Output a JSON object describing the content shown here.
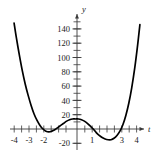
{
  "figure": {
    "title": "",
    "axis_labels": {
      "x": "t",
      "y": "y"
    },
    "colors": {
      "curve": "#000000",
      "axis": "#3a3a3a",
      "text": "#1a1a1a",
      "background": "#ffffff"
    }
  },
  "chart_data": {
    "type": "line",
    "title": "",
    "xlabel": "t",
    "ylabel": "y",
    "xlim": [
      -4.6,
      4.8
    ],
    "ylim": [
      -28,
      152
    ],
    "grid": false,
    "legend": null,
    "xticks": [
      -4,
      -3,
      -2,
      -1,
      0,
      1,
      2,
      3,
      4
    ],
    "xtick_labels": [
      "-4",
      "-3",
      "-2",
      "",
      "",
      "1",
      "",
      "3",
      "4"
    ],
    "yticks": [
      -20,
      20,
      40,
      60,
      80,
      100,
      120,
      140
    ],
    "ytick_labels": [
      "-20",
      "20",
      "40",
      "60",
      "80",
      "100",
      "120",
      "140"
    ],
    "minor_xtick_step": 0.5,
    "minor_ytick_step": 10,
    "series": [
      {
        "name": "curve",
        "x": [
          -4.25,
          -4.1,
          -3.9,
          -3.7,
          -3.5,
          -3.3,
          -3.1,
          -2.9,
          -2.7,
          -2.5,
          -2.3,
          -2.1,
          -1.9,
          -1.7,
          -1.5,
          -1.3,
          -1.1,
          -0.9,
          -0.7,
          -0.5,
          -0.3,
          -0.1,
          0.1,
          0.3,
          0.5,
          0.7,
          0.9,
          1.1,
          1.3,
          1.5,
          1.7,
          1.9,
          2.1,
          2.3,
          2.5,
          2.7,
          2.9,
          3.1,
          3.3,
          3.5,
          3.7,
          3.9,
          4.1,
          4.25
        ],
        "y": [
          148,
          128,
          104,
          82,
          63,
          47,
          33,
          21,
          12,
          5,
          0,
          -3,
          -4,
          -3,
          -1,
          2,
          5,
          8,
          11,
          13,
          14,
          14,
          14,
          13,
          11,
          8,
          4,
          0,
          -5,
          -9,
          -12,
          -14,
          -15,
          -15,
          -13,
          -9,
          -3,
          6,
          19,
          36,
          58,
          85,
          118,
          146
        ]
      }
    ],
    "features": {
      "local_minimum_left": {
        "t": -2.0,
        "y": -4
      },
      "local_maximum": {
        "t": 0.1,
        "y": 14
      },
      "local_minimum_right": {
        "t": 2.2,
        "y": -15
      }
    }
  }
}
